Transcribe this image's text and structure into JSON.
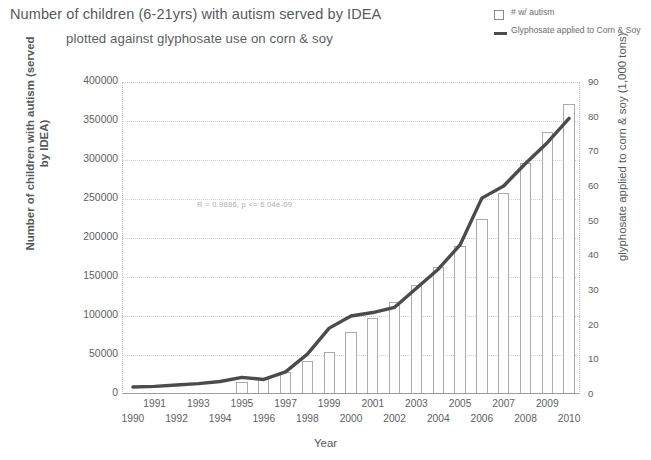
{
  "title": {
    "line1": "Number of children (6-21yrs) with autism served by IDEA",
    "line2": "plotted against glyphosate use on corn & soy"
  },
  "legend": {
    "items": [
      {
        "label": "# w/ autism",
        "marker": "bar-swatch-icon",
        "color": "#8a8d90"
      },
      {
        "label": "Glyphosate applied to Corn & Soy",
        "marker": "line-swatch-icon",
        "color": "#4c4c4c"
      }
    ]
  },
  "axes": {
    "left_title": "Number of children with autism (served by IDEA)",
    "right_title": "glyphosate applied to corn & soy (1,000 tons)",
    "x_title": "Year"
  },
  "annotation": "R = 0.9886, p <= 6.04e-09",
  "chart_data": {
    "type": "bar",
    "title": "Number of children (6-21yrs) with autism served by IDEA plotted against glyphosate use on corn & soy",
    "xlabel": "Year",
    "ylabel": "Number of children with autism (served by IDEA)",
    "y2label": "glyphosate applied to corn & soy (1,000 tons)",
    "categories": [
      "1990",
      "1991",
      "1992",
      "1993",
      "1994",
      "1995",
      "1996",
      "1997",
      "1998",
      "1999",
      "2000",
      "2001",
      "2002",
      "2003",
      "2004",
      "2005",
      "2006",
      "2007",
      "2008",
      "2009",
      "2010"
    ],
    "ylim": [
      0,
      400000
    ],
    "yticks": [
      0,
      50000,
      100000,
      150000,
      200000,
      250000,
      300000,
      350000,
      400000
    ],
    "ytick_labels": [
      "0",
      "50000",
      "100000",
      "150000",
      "200000",
      "250000",
      "300000",
      "350000",
      "400000"
    ],
    "y2lim": [
      0,
      90
    ],
    "y2ticks": [
      0,
      10,
      20,
      30,
      40,
      50,
      60,
      70,
      80,
      90
    ],
    "y2tick_labels": [
      "0",
      "10",
      "20",
      "30",
      "40",
      "50",
      "60",
      "70",
      "80",
      "90"
    ],
    "grid": true,
    "legend_position": "top-right",
    "series": [
      {
        "name": "# w/ autism",
        "kind": "bar",
        "axis": "left",
        "values": [
          0,
          0,
          0,
          0,
          0,
          15000,
          20000,
          28000,
          42000,
          54000,
          80000,
          97000,
          118000,
          140000,
          163000,
          190000,
          224000,
          258000,
          296000,
          336000,
          372000
        ]
      },
      {
        "name": "Glyphosate applied to Corn & Soy",
        "kind": "line",
        "axis": "right",
        "values": [
          2.0,
          2.2,
          2.6,
          3.0,
          3.6,
          4.8,
          4.2,
          6.4,
          11.5,
          19.0,
          22.5,
          23.5,
          25.0,
          30.5,
          36.0,
          43.0,
          56.5,
          60.0,
          66.5,
          72.5,
          79.5
        ]
      }
    ],
    "annotations": [
      "R = 0.9886, p <= 6.04e-09"
    ]
  }
}
